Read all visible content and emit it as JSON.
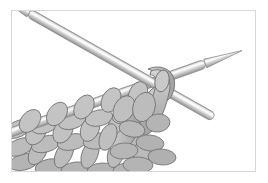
{
  "figure": {
    "alt_text": "Line drawing of knitting: the right-hand needle crosses over the left-hand needle and a new loop of yarn is wrapped around it, with rows of finished stitches below.",
    "background_color": "#ffffff",
    "border_color": "#d8d8d8",
    "frame": {
      "x": 11,
      "y": 10,
      "width": 245,
      "height": 162
    }
  },
  "palette": {
    "yarn_fill": "#b9b9b9",
    "yarn_fill_light": "#cfcfcf",
    "yarn_fill_dark": "#9e9e9e",
    "yarn_outline": "#6e6e6e",
    "needle_light": "#fbfbfb",
    "needle_mid": "#cccccc",
    "needle_dark": "#9a9a9a",
    "needle_outline": "#8a8a8a"
  },
  "objects": {
    "needle_upper_left": {
      "label": "left-hand knitting needle",
      "tip": {
        "x": 24,
        "y": 10
      },
      "end": {
        "x": 205,
        "y": 112
      },
      "thickness": 9
    },
    "needle_lower_right": {
      "label": "right-hand knitting needle",
      "tip": {
        "x": 232,
        "y": 55
      },
      "end": {
        "x": 0,
        "y": 128
      },
      "thickness": 9
    },
    "working_loop": {
      "label": "new loop wrapped over right needle",
      "center": {
        "x": 150,
        "y": 84
      }
    },
    "fabric": {
      "label": "knitted fabric of completed stitches",
      "stitch_rows": 3,
      "stitches_on_needle": 6
    }
  }
}
